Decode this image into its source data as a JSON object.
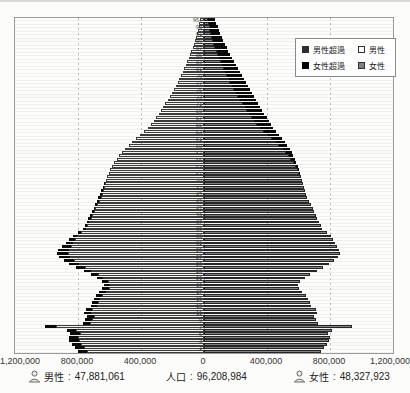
{
  "colors": {
    "male_fill": "#f6f5f0",
    "male_border": "#3c3c3c",
    "female_fill": "#828282",
    "female_border": "#262626",
    "excess_black": "#0a0a0a",
    "plot_border": "#9a9a9a",
    "gridline": "#bdbdbd"
  },
  "legend": {
    "items": [
      {
        "label": "男性超過",
        "swatch": "male-excess"
      },
      {
        "label": "男性",
        "swatch": "male"
      },
      {
        "label": "女性超過",
        "swatch": "female-excess"
      },
      {
        "label": "女性",
        "swatch": "female"
      }
    ]
  },
  "summary": {
    "separator": ":",
    "male": {
      "label": "男性",
      "value": "47,881,061"
    },
    "population": {
      "label": "人口",
      "value": "96,208,984"
    },
    "female": {
      "label": "女性",
      "value": "48,327,923"
    }
  },
  "chart_data": {
    "type": "bar",
    "variant": "population_pyramid",
    "orientation": "horizontal",
    "x_tick_labels": [
      "1,200,000",
      "800,000",
      "400,000",
      "0",
      "400,000",
      "800,000",
      "1,200,000"
    ],
    "xlim": [
      -1200000,
      1200000
    ],
    "grid": "dotted-vertical",
    "legend_position": "top-right",
    "age_min": 0,
    "age_max_label": "95+",
    "age_labels": [
      "95+",
      "93",
      "91",
      "89",
      "87",
      "85",
      "83",
      "81",
      "79",
      "77",
      "75",
      "73",
      "71",
      "69",
      "67",
      "65",
      "63",
      "61",
      "59",
      "57",
      "55",
      "53",
      "51",
      "49",
      "47",
      "45",
      "43",
      "41",
      "39",
      "37",
      "35",
      "33",
      "31",
      "29",
      "27",
      "25",
      "23",
      "21",
      "19",
      "17",
      "15",
      "13",
      "11",
      "9",
      "7",
      "5",
      "3",
      "1"
    ],
    "excess_encoding": "black tip drawn on the longer side's bar end (male excess left, female excess right)",
    "series": [
      {
        "name": "男性",
        "side": "left",
        "values_by_age_0_to_95": [
          800000,
          820000,
          840000,
          855000,
          860000,
          850000,
          870000,
          1010000,
          770000,
          755000,
          745000,
          765000,
          750000,
          720000,
          710000,
          700000,
          685000,
          665000,
          645000,
          635000,
          650000,
          680000,
          715000,
          760000,
          810000,
          855000,
          890000,
          920000,
          935000,
          925000,
          900000,
          875000,
          855000,
          830000,
          800000,
          768000,
          757000,
          746000,
          734000,
          722000,
          710000,
          700000,
          690000,
          680000,
          670000,
          661000,
          652000,
          643000,
          634000,
          625000,
          616000,
          606000,
          595000,
          583000,
          570000,
          555000,
          538000,
          520000,
          500000,
          478000,
          455000,
          430000,
          405000,
          380000,
          355000,
          334000,
          318000,
          303000,
          288000,
          273000,
          259000,
          245000,
          231000,
          218000,
          205000,
          192000,
          180000,
          168000,
          157000,
          146000,
          135000,
          125000,
          115000,
          106000,
          97000,
          88000,
          80000,
          72000,
          65000,
          58000,
          52000,
          46000,
          40000,
          35000,
          30000,
          25000
        ]
      },
      {
        "name": "女性",
        "side": "right",
        "values_by_age_0_to_95": [
          740000,
          760000,
          780000,
          795000,
          800000,
          790000,
          810000,
          940000,
          725000,
          710000,
          700000,
          720000,
          710000,
          680000,
          670000,
          660000,
          645000,
          625000,
          605000,
          595000,
          610000,
          640000,
          675000,
          715000,
          755000,
          795000,
          825000,
          850000,
          865000,
          860000,
          845000,
          830000,
          820000,
          805000,
          780000,
          750000,
          740000,
          730000,
          720000,
          710000,
          700000,
          690000,
          678000,
          667000,
          657000,
          648000,
          640000,
          633000,
          626000,
          620000,
          614000,
          608000,
          602000,
          595000,
          587000,
          578000,
          568000,
          556000,
          543000,
          528000,
          512000,
          494000,
          476000,
          458000,
          440000,
          424000,
          410000,
          397000,
          384000,
          371000,
          358000,
          345000,
          332000,
          319000,
          306000,
          293000,
          280000,
          267000,
          254000,
          241000,
          228000,
          215000,
          202000,
          190000,
          178000,
          166000,
          155000,
          144000,
          133000,
          123000,
          113000,
          104000,
          95000,
          86000,
          78000,
          70000
        ]
      }
    ]
  }
}
